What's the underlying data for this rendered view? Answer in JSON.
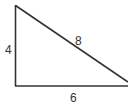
{
  "diagram": {
    "type": "right-triangle",
    "stroke_color": "#333333",
    "background": "#ffffff",
    "sides": {
      "left": {
        "label": "4"
      },
      "hypotenuse": {
        "label": "8"
      },
      "bottom": {
        "label": "6"
      }
    }
  }
}
